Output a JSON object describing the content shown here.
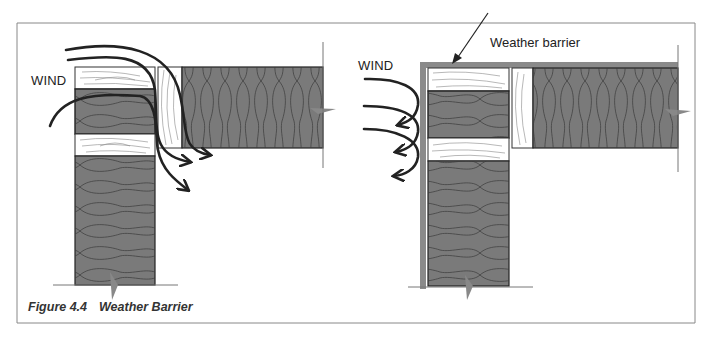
{
  "figure": {
    "caption_number": "Figure 4.4",
    "caption_title": "Weather Barrier"
  },
  "left_panel": {
    "wind_label": "WIND",
    "description": "Wall without weather barrier: wind passes through framing gaps into the wall and floor cavities"
  },
  "right_panel": {
    "wind_label": "WIND",
    "barrier_label": "Weather barrier",
    "description": "Wall with continuous weather barrier: wind is deflected at the exterior face"
  },
  "colors": {
    "insulation": "#7a7a7a",
    "wood": "#ffffff",
    "barrier": "#8a8a8a",
    "arrow": "#222222",
    "frame": "#888888"
  }
}
